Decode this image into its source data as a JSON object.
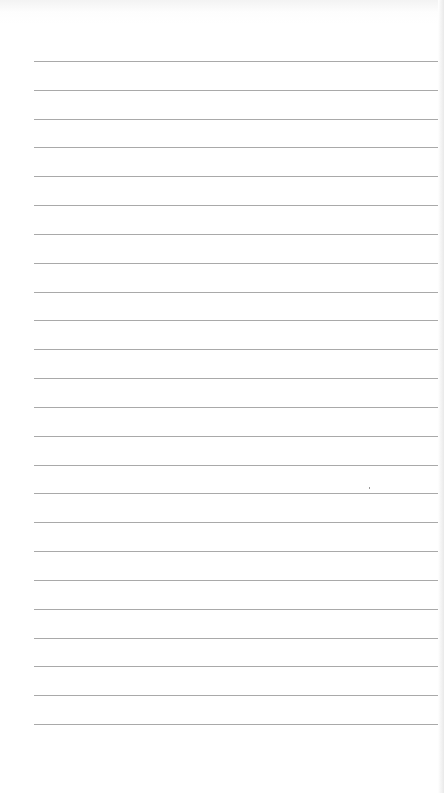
{
  "page": {
    "type": "lined-paper",
    "line_count": 24,
    "first_line_y": 61,
    "line_spacing_px": 28.83,
    "line_left_x": 34,
    "line_color": "#a9a9a9",
    "background_color": "#ffffff",
    "content_text": ""
  }
}
